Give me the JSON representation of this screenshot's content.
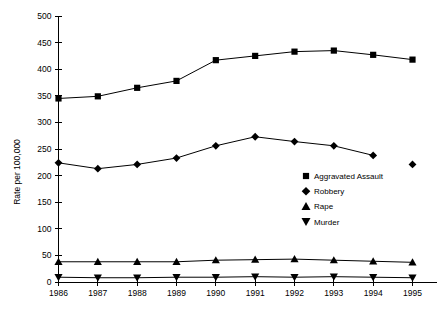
{
  "chart_data": {
    "type": "line",
    "title": "",
    "xlabel": "",
    "ylabel": "Rate per 100,000",
    "categories": [
      "1986",
      "1987",
      "1988",
      "1989",
      "1990",
      "1991",
      "1992",
      "1993",
      "1994",
      "1995"
    ],
    "ylim": [
      0,
      500
    ],
    "ytick_values": [
      0,
      50,
      100,
      150,
      200,
      250,
      300,
      350,
      400,
      450,
      500
    ],
    "ytick_labels": [
      "0",
      "50",
      "100",
      "150",
      "200",
      "250",
      "300",
      "350",
      "400",
      "450",
      "500"
    ],
    "grid": false,
    "legend_position": "center-right",
    "series": [
      {
        "name": "Aggravated Assault",
        "marker": "square",
        "values": [
          345,
          349,
          365,
          378,
          417,
          425,
          433,
          435,
          427,
          418
        ]
      },
      {
        "name": "Robbery",
        "marker": "diamond",
        "values": [
          224,
          213,
          221,
          233,
          256,
          273,
          264,
          256,
          238,
          221
        ],
        "gap_after_index": 8
      },
      {
        "name": "Rape",
        "marker": "triangle-up",
        "values": [
          38,
          38,
          38,
          38,
          41,
          42,
          43,
          41,
          39,
          37
        ]
      },
      {
        "name": "Murder",
        "marker": "triangle-down",
        "values": [
          9,
          8,
          8,
          9,
          9,
          10,
          9,
          10,
          9,
          8
        ]
      }
    ]
  },
  "legend": {
    "items": [
      {
        "label": "Aggravated Assault",
        "marker": "square"
      },
      {
        "label": "Robbery",
        "marker": "diamond"
      },
      {
        "label": "Rape",
        "marker": "triangle-up"
      },
      {
        "label": "Murder",
        "marker": "triangle-down"
      }
    ]
  }
}
